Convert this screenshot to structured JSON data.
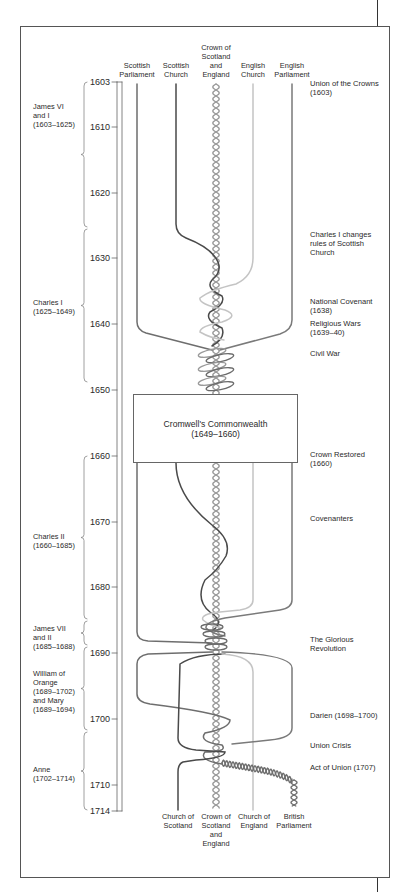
{
  "diagram": {
    "colors": {
      "frame": "#555555",
      "scottish_parliament": "#6e6e6e",
      "scottish_church": "#4a4a4a",
      "crown": "#9a9a9a",
      "english_church": "#c4c4c4",
      "english_parliament": "#7a7a7a"
    },
    "top_columns": [
      {
        "id": "scottish-parliament",
        "lines": [
          "Scottish",
          "Parliament"
        ],
        "x": 137
      },
      {
        "id": "scottish-church",
        "lines": [
          "Scottish",
          "Church"
        ],
        "x": 176
      },
      {
        "id": "crown",
        "lines": [
          "Crown of",
          "Scotland",
          "and",
          "England"
        ],
        "x": 216
      },
      {
        "id": "english-church",
        "lines": [
          "English",
          "Church"
        ],
        "x": 253
      },
      {
        "id": "english-parliament",
        "lines": [
          "English",
          "Parliament"
        ],
        "x": 292
      }
    ],
    "bottom_columns": [
      {
        "id": "church-of-scotland",
        "lines": [
          "Church of",
          "Scotland"
        ],
        "x": 178
      },
      {
        "id": "crown-bottom",
        "lines": [
          "Crown of",
          "Scotland",
          "and",
          "England"
        ],
        "x": 216
      },
      {
        "id": "church-of-england",
        "lines": [
          "Church of",
          "England"
        ],
        "x": 254
      },
      {
        "id": "british-parliament",
        "lines": [
          "British",
          "Parliament"
        ],
        "x": 294
      }
    ],
    "years": [
      {
        "label": "1603",
        "y": 82
      },
      {
        "label": "1610",
        "y": 127
      },
      {
        "label": "1620",
        "y": 193
      },
      {
        "label": "1630",
        "y": 258
      },
      {
        "label": "1640",
        "y": 324
      },
      {
        "label": "1650",
        "y": 390
      },
      {
        "label": "1660",
        "y": 456
      },
      {
        "label": "1670",
        "y": 522
      },
      {
        "label": "1680",
        "y": 587
      },
      {
        "label": "1690",
        "y": 653
      },
      {
        "label": "1700",
        "y": 719
      },
      {
        "label": "1710",
        "y": 785
      },
      {
        "label": "1714",
        "y": 811
      }
    ],
    "reigns": [
      {
        "lines": [
          "James VI",
          "and I",
          "(1603–1625)"
        ],
        "y": 102,
        "brace_top": 82,
        "brace_bottom": 227
      },
      {
        "lines": [
          "Charles I",
          "(1625–1649)"
        ],
        "y": 298,
        "brace_top": 229,
        "brace_bottom": 382
      },
      {
        "lines": [
          "Charles II",
          "(1660–1685)"
        ],
        "y": 532,
        "brace_top": 456,
        "brace_bottom": 619
      },
      {
        "lines": [
          "James VII",
          "and II",
          "(1685–1688)"
        ],
        "y": 624,
        "brace_top": 621,
        "brace_bottom": 645
      },
      {
        "lines": [
          "William of",
          "Orange",
          "(1689–1702)",
          "and Mary",
          "(1689–1694)"
        ],
        "y": 669,
        "brace_top": 647,
        "brace_bottom": 730
      },
      {
        "lines": [
          "Anne",
          "(1702–1714)"
        ],
        "y": 765,
        "brace_top": 732,
        "brace_bottom": 810
      }
    ],
    "events": [
      {
        "lines": [
          "Union of the Crowns",
          "(1603)"
        ],
        "y": 79
      },
      {
        "lines": [
          "Charles I changes",
          "rules of Scottish",
          "Church"
        ],
        "y": 230
      },
      {
        "lines": [
          "National Covenant",
          "(1638)"
        ],
        "y": 297
      },
      {
        "lines": [
          "Religious Wars",
          "(1639–40)"
        ],
        "y": 319
      },
      {
        "lines": [
          "Civil War"
        ],
        "y": 349
      },
      {
        "lines": [
          "Crown Restored",
          "(1660)"
        ],
        "y": 450
      },
      {
        "lines": [
          "Covenanters"
        ],
        "y": 514
      },
      {
        "lines": [
          "The Glorious",
          "Revolution"
        ],
        "y": 635
      },
      {
        "lines": [
          "Darien (1698–1700)"
        ],
        "y": 711
      },
      {
        "lines": [
          "Union Crisis"
        ],
        "y": 741
      },
      {
        "lines": [
          "Act of Union (1707)"
        ],
        "y": 763
      }
    ],
    "commonwealth": {
      "title": "Cromwell's Commonwealth",
      "dates": "(1649–1660)"
    }
  }
}
